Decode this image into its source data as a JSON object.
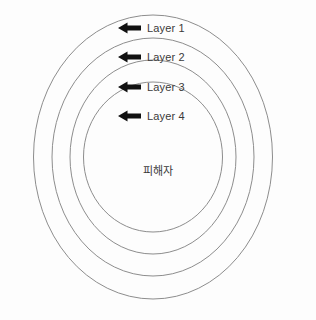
{
  "diagram": {
    "type": "concentric-rings",
    "background_color": "#fdfdfd",
    "ring_stroke_color": "#8d8d8d",
    "arrow_color": "#111111",
    "text_color": "#3a3a3a",
    "center_label": "피해자",
    "rings": [
      {
        "label": "Layer 1",
        "arrow_icon": "arrow-left-icon",
        "order": 1
      },
      {
        "label": "Layer 2",
        "arrow_icon": "arrow-left-icon",
        "order": 2
      },
      {
        "label": "Layer 3",
        "arrow_icon": "arrow-left-icon",
        "order": 3
      },
      {
        "label": "Layer 4",
        "arrow_icon": "arrow-left-icon",
        "order": 4
      }
    ]
  }
}
